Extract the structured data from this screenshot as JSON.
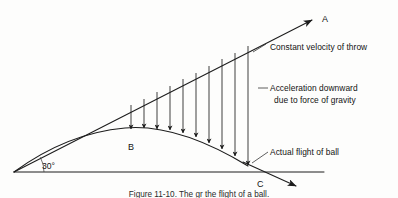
{
  "figure": {
    "background_color": "#fdfdfc",
    "ink_color": "#1c1c1c",
    "caption": "Figure 11-10. The gr the flight of a ball."
  },
  "annotations": {
    "constant_velocity": "Constant velocity of throw",
    "acceleration_line1": "Acceleration downward",
    "acceleration_line2": "due to force of gravity",
    "actual_flight": "Actual flight of ball"
  },
  "points": {
    "a": "A",
    "b": "B",
    "c": "C"
  },
  "angle": {
    "value": "30°"
  },
  "chart_data": {
    "type": "line",
    "xlabel": "",
    "ylabel": "",
    "grid": false,
    "legend_position": "right",
    "xlim": [
      0,
      398
    ],
    "ylim": [
      0,
      198
    ],
    "launch_angle_degrees": 30,
    "origin_px": [
      14,
      172
    ],
    "series": [
      {
        "name": "Constant velocity of throw",
        "type": "ray",
        "style": "straight-arrow",
        "points": [
          [
            14,
            172
          ],
          [
            316,
            18
          ]
        ],
        "arrowhead_at_end": true,
        "end_label": "A"
      },
      {
        "name": "Actual flight of ball",
        "type": "parabola",
        "style": "curve",
        "points": [
          [
            14,
            172
          ],
          [
            60,
            148
          ],
          [
            100,
            134
          ],
          [
            140,
            128
          ],
          [
            180,
            132
          ],
          [
            215,
            145
          ],
          [
            243,
            161
          ],
          [
            262,
            172
          ]
        ],
        "apex_label": "B",
        "apex_px": [
          140,
          128
        ],
        "ground_crossing_label": "C",
        "ground_crossing_px": [
          262,
          172
        ]
      },
      {
        "name": "Ground line",
        "type": "horizontal-line",
        "points": [
          [
            14,
            172
          ],
          [
            324,
            172
          ]
        ]
      },
      {
        "name": "Downward continuation of flight",
        "type": "ray",
        "style": "straight-arrow",
        "points": [
          [
            243,
            161
          ],
          [
            300,
            188
          ]
        ],
        "arrowhead_at_end": true
      }
    ],
    "drop_arrows": {
      "name": "Acceleration downward due to force of gravity",
      "description": "Vertical arrows from the constant-velocity ray down to the actual flight parabola",
      "count": 10,
      "arrowhead": "down",
      "segments": [
        {
          "x": 131,
          "y_top": 105,
          "y_bottom": 129
        },
        {
          "x": 144,
          "y_top": 99,
          "y_bottom": 128
        },
        {
          "x": 157,
          "y_top": 92,
          "y_bottom": 129
        },
        {
          "x": 170,
          "y_top": 86,
          "y_bottom": 130
        },
        {
          "x": 183,
          "y_top": 79,
          "y_bottom": 133
        },
        {
          "x": 196,
          "y_top": 73,
          "y_bottom": 137
        },
        {
          "x": 209,
          "y_top": 66,
          "y_bottom": 143
        },
        {
          "x": 222,
          "y_top": 59,
          "y_bottom": 149
        },
        {
          "x": 235,
          "y_top": 53,
          "y_bottom": 156
        },
        {
          "x": 248,
          "y_top": 46,
          "y_bottom": 165
        }
      ]
    },
    "annotations_list": [
      {
        "text": "Constant velocity of throw",
        "anchor_px": [
          262,
          46
        ],
        "text_px": [
          272,
          48
        ]
      },
      {
        "text": "Acceleration downward",
        "anchor_px": [
          262,
          88
        ],
        "text_px": [
          272,
          90
        ]
      },
      {
        "text": "due to force of gravity",
        "anchor_px": null,
        "text_px": [
          276,
          101
        ]
      },
      {
        "text": "Actual flight of ball",
        "anchor_px": [
          258,
          160
        ],
        "text_px": [
          272,
          155
        ]
      }
    ]
  }
}
